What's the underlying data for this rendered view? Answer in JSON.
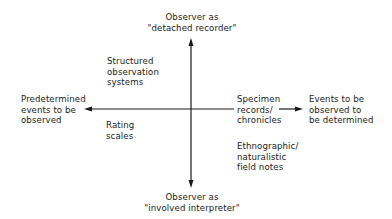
{
  "diagram": {
    "axes": {
      "vertical": {
        "top_label": "Observer as\n\"detached recorder\"",
        "bottom_label": "Observer as\n\"involved interpreter\""
      },
      "horizontal": {
        "left_label": "Predetermined\nevents to be\nobserved",
        "right_label": "Events to be\nobserved to\nbe determined"
      }
    },
    "items": [
      {
        "id": "structured-observation-systems",
        "label": "Structured\nobservation\nsystems",
        "quadrant": "upper-left"
      },
      {
        "id": "rating-scales",
        "label": "Rating\nscales",
        "quadrant": "lower-left"
      },
      {
        "id": "specimen-records",
        "label": "Specimen\nrecords/\nchronicles",
        "quadrant": "right-on-axis"
      },
      {
        "id": "ethnographic-field-notes",
        "label": "Ethnographic/\nnaturalistic\nfield notes",
        "quadrant": "lower-right"
      }
    ],
    "colors": {
      "line": "#1a1a1a",
      "background": "#ffffff"
    }
  }
}
